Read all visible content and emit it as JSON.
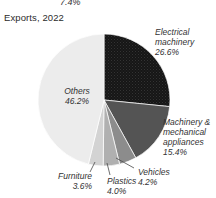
{
  "page": {
    "title": "Exports, 2022",
    "cropped_top_label": "7.4%"
  },
  "chart_data": {
    "type": "pie",
    "title": "Exports, 2022",
    "unit": "%",
    "start_angle_deg": -90,
    "direction": "clockwise",
    "legend": "none",
    "slices": [
      {
        "label": "Electrical machinery",
        "value": 26.6,
        "pct_label": "26.6%",
        "color": "#161616",
        "textured": true
      },
      {
        "label": "Machinery & mechanical appliances",
        "value": 15.4,
        "pct_label": "15.4%",
        "color": "#545454",
        "textured": false
      },
      {
        "label": "Vehicles",
        "value": 4.2,
        "pct_label": "4.2%",
        "color": "#8c8c8c",
        "textured": false
      },
      {
        "label": "Plastics",
        "value": 4.0,
        "pct_label": "4.0%",
        "color": "#b0b0b0",
        "textured": false
      },
      {
        "label": "Furniture",
        "value": 3.6,
        "pct_label": "3.6%",
        "color": "#d3d3d3",
        "textured": false
      },
      {
        "label": "Others",
        "value": 46.2,
        "pct_label": "46.2%",
        "color": "#ececec",
        "textured": false
      }
    ]
  }
}
